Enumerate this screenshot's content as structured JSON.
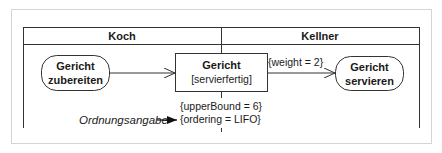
{
  "diagram": {
    "type": "UML activity diagram with swimlanes",
    "swimlanes": [
      {
        "label": "Koch"
      },
      {
        "label": "Kellner"
      }
    ],
    "actions": {
      "prepare": {
        "line1": "Gericht",
        "line2": "zubereiten"
      },
      "serve": {
        "line1": "Gericht",
        "line2": "servieren"
      }
    },
    "object_node": {
      "name": "Gericht",
      "state": "[servierfertig]"
    },
    "edge_label": "{weight = 2}",
    "constraints": {
      "upper_bound": "{upperBound = 6}",
      "ordering": "{ordering = LIFO}"
    },
    "annotation": "Ordnungsangabe"
  }
}
